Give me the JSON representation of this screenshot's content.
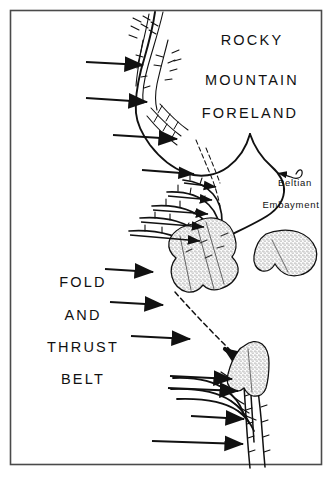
{
  "figure": {
    "frame_color": "#4a4a4a",
    "line_color": "#111111",
    "background_color": "#ffffff",
    "stipple_fill_color": "#cfcfcf"
  },
  "labels": {
    "region": [
      {
        "text": "ROCKY",
        "x": 252,
        "y": 45
      },
      {
        "text": "MOUNTAIN",
        "x": 252,
        "y": 85
      },
      {
        "text": "FORELAND",
        "x": 250,
        "y": 118
      }
    ],
    "belt": [
      {
        "text": "FOLD",
        "x": 83,
        "y": 287
      },
      {
        "text": "AND",
        "x": 83,
        "y": 320
      },
      {
        "text": "THRUST",
        "x": 83,
        "y": 352
      },
      {
        "text": "BELT",
        "x": 83,
        "y": 384
      }
    ],
    "feature": [
      {
        "text": "Beltian",
        "x": 295,
        "y": 186
      },
      {
        "text": "Embayment",
        "x": 291,
        "y": 208
      }
    ]
  },
  "annotations": {
    "compression_arrow_count": 9,
    "thrust_fault_label": "thrust fault trace",
    "stippled_body_label": "stippled intrusive body",
    "leader_arrow_label": "Beltian Embayment leader"
  }
}
